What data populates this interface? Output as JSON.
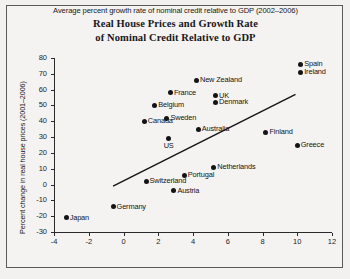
{
  "chart_data": {
    "type": "scatter",
    "title": "Real House Prices and Growth Rate of Nominal Credit Relative to GDP",
    "title_line1": "Real House Prices and Growth Rate",
    "title_line2": "of Nominal Credit Relative to GDP",
    "xlabel": "Average percent growth rate of nominal credit relative to GDP (2002–2006)",
    "ylabel": "Percent change in real house prices (2001–2006)",
    "xlim": [
      -4,
      12
    ],
    "ylim": [
      -30,
      80
    ],
    "xticks": [
      -4,
      -2,
      0,
      2,
      4,
      6,
      8,
      10,
      12
    ],
    "xtick_labels": [
      "-4",
      "-2",
      "0",
      "2",
      "4",
      "6",
      "8",
      "10",
      "12"
    ],
    "yticks": [
      -30,
      -20,
      -10,
      0,
      10,
      20,
      30,
      40,
      50,
      60,
      70,
      80
    ],
    "ytick_labels": [
      "-30",
      "-20",
      "-10",
      "0",
      "10",
      "20",
      "30",
      "40",
      "50",
      "60",
      "70",
      "80"
    ],
    "grid": false,
    "legend": "none",
    "marker_color": "#141416",
    "trendline": {
      "label": "linear fit",
      "x": [
        -0.6,
        9.9
      ],
      "y": [
        -1,
        57
      ]
    },
    "points": [
      {
        "label": "Spain",
        "x": 10.2,
        "y": 76,
        "label_pos": "right"
      },
      {
        "label": "Ireland",
        "x": 10.2,
        "y": 71,
        "label_pos": "right"
      },
      {
        "label": "New Zealand",
        "x": 4.2,
        "y": 66,
        "label_pos": "right"
      },
      {
        "label": "France",
        "x": 2.7,
        "y": 58,
        "label_pos": "right"
      },
      {
        "label": "UK",
        "x": 5.3,
        "y": 56,
        "label_pos": "right"
      },
      {
        "label": "Denmark",
        "x": 5.3,
        "y": 52,
        "label_pos": "right"
      },
      {
        "label": "Belgium",
        "x": 1.8,
        "y": 50,
        "label_pos": "right"
      },
      {
        "label": "Sweden",
        "x": 2.5,
        "y": 42,
        "label_pos": "right"
      },
      {
        "label": "Canada",
        "x": 1.2,
        "y": 40,
        "label_pos": "right"
      },
      {
        "label": "Australia",
        "x": 4.3,
        "y": 35,
        "label_pos": "right"
      },
      {
        "label": "Finland",
        "x": 8.2,
        "y": 33,
        "label_pos": "right"
      },
      {
        "label": "US",
        "x": 2.6,
        "y": 29,
        "label_pos": "below"
      },
      {
        "label": "Greece",
        "x": 10.0,
        "y": 25,
        "label_pos": "right"
      },
      {
        "label": "Netherlands",
        "x": 5.2,
        "y": 11,
        "label_pos": "right"
      },
      {
        "label": "Portugal",
        "x": 3.5,
        "y": 6,
        "label_pos": "right"
      },
      {
        "label": "Switzerland",
        "x": 1.3,
        "y": 2,
        "label_pos": "right"
      },
      {
        "label": "Austria",
        "x": 2.9,
        "y": -4,
        "label_pos": "right"
      },
      {
        "label": "Germany",
        "x": -0.6,
        "y": -14,
        "label_pos": "right"
      },
      {
        "label": "Japan",
        "x": -3.3,
        "y": -21,
        "label_pos": "right"
      }
    ]
  }
}
